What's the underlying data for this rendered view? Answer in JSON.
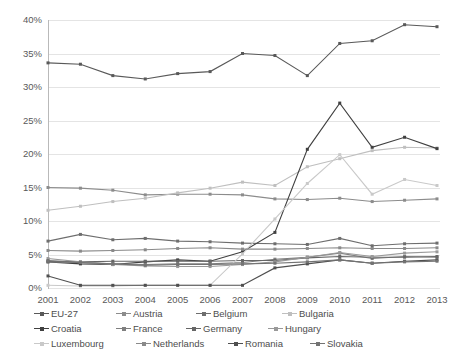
{
  "chart_data": {
    "type": "line",
    "title": "",
    "xlabel": "",
    "ylabel": "",
    "ylim": [
      0,
      40
    ],
    "ytick_step": 5,
    "grid": true,
    "legend_position": "bottom",
    "tick_suffix": "%",
    "categories": [
      "2001",
      "2002",
      "2003",
      "2004",
      "2005",
      "2006",
      "2007",
      "2008",
      "2009",
      "2010",
      "2011",
      "2012",
      "2013"
    ],
    "ytick_labels": [
      "0%",
      "5%",
      "10%",
      "15%",
      "20%",
      "25%",
      "30%",
      "35%",
      "40%"
    ],
    "series": [
      {
        "name": "EU-27",
        "color": "#595959",
        "values": [
          33.6,
          33.4,
          31.7,
          31.2,
          32.0,
          32.3,
          35.0,
          34.7,
          31.7,
          36.5,
          36.9,
          39.3,
          39.0
        ]
      },
      {
        "name": "Austria",
        "color": "#8c8c8c",
        "values": [
          15.0,
          14.9,
          14.6,
          13.9,
          14.0,
          14.0,
          13.9,
          13.3,
          13.2,
          13.4,
          12.9,
          13.1,
          13.3
        ]
      },
      {
        "name": "Belgium",
        "color": "#6e6e6e",
        "values": [
          7.0,
          8.0,
          7.2,
          7.4,
          7.0,
          6.9,
          6.7,
          6.6,
          6.5,
          7.4,
          6.3,
          6.6,
          6.7
        ]
      },
      {
        "name": "Bulgaria",
        "color": "#bfbfbf",
        "values": [
          11.6,
          12.2,
          12.9,
          13.4,
          14.2,
          14.9,
          15.8,
          15.3,
          18.1,
          19.3,
          20.5,
          21.0,
          20.9
        ]
      },
      {
        "name": "Croatia",
        "color": "#404040",
        "values": [
          3.9,
          3.6,
          3.5,
          3.9,
          4.2,
          4.0,
          5.4,
          8.3,
          20.7,
          27.6,
          21.0,
          22.5,
          20.8
        ]
      },
      {
        "name": "France",
        "color": "#7f7f7f",
        "values": [
          3.9,
          3.8,
          3.6,
          3.5,
          3.6,
          3.6,
          3.8,
          4.3,
          4.6,
          5.2,
          4.4,
          4.7,
          4.6
        ]
      },
      {
        "name": "Germany",
        "color": "#666666",
        "values": [
          4.0,
          3.9,
          4.0,
          4.0,
          4.0,
          4.0,
          4.1,
          4.1,
          4.5,
          4.7,
          4.6,
          4.6,
          4.7
        ]
      },
      {
        "name": "Hungary",
        "color": "#999999",
        "values": [
          4.4,
          3.9,
          3.5,
          3.3,
          3.2,
          3.2,
          3.5,
          3.9,
          4.6,
          5.3,
          4.7,
          5.2,
          5.4
        ]
      },
      {
        "name": "Luxembourg",
        "color": "#c9c9c9",
        "values": [
          0.4,
          0.3,
          0.3,
          0.4,
          0.4,
          0.4,
          5.1,
          10.3,
          15.6,
          19.9,
          14.0,
          16.2,
          15.3
        ]
      },
      {
        "name": "Netherlands",
        "color": "#8a8a8a",
        "values": [
          5.6,
          5.5,
          5.6,
          5.7,
          5.9,
          6.0,
          5.8,
          5.8,
          5.9,
          6.0,
          5.9,
          5.9,
          6.0
        ]
      },
      {
        "name": "Romania",
        "color": "#4f4f4f",
        "values": [
          1.8,
          0.4,
          0.4,
          0.4,
          0.4,
          0.4,
          0.4,
          3.0,
          3.6,
          4.2,
          3.7,
          4.0,
          4.2
        ]
      },
      {
        "name": "Slovakia",
        "color": "#737373",
        "values": [
          4.1,
          3.8,
          3.6,
          3.4,
          3.5,
          3.5,
          3.6,
          3.7,
          3.9,
          4.2,
          3.7,
          3.9,
          4.0
        ]
      }
    ]
  },
  "legend": {
    "items": [
      "EU-27",
      "Austria",
      "Belgium",
      "Bulgaria",
      "Croatia",
      "France",
      "Germany",
      "Hungary",
      "Luxembourg",
      "Netherlands",
      "Romania",
      "Slovakia"
    ]
  }
}
